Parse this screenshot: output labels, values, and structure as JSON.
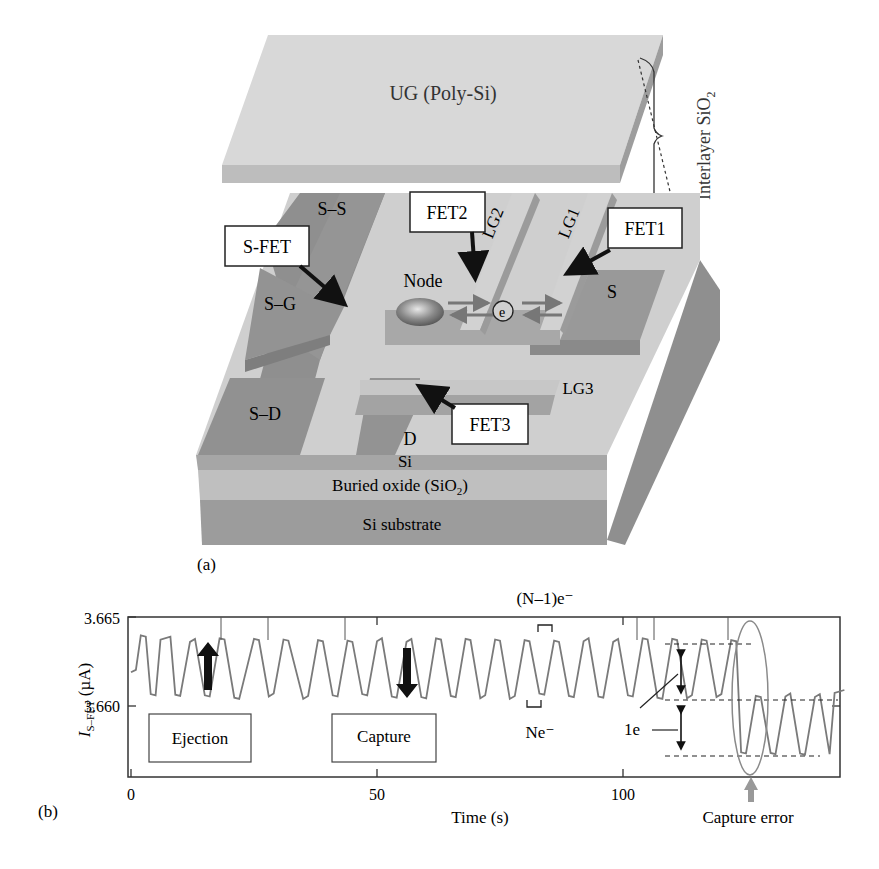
{
  "panel_a": {
    "label": "(a)",
    "top_gate": "UG (Poly-Si)",
    "interlayer": "Interlayer SiO",
    "interlayer_sub": "2",
    "regions": {
      "ss": "S–S",
      "sg": "S–G",
      "sd": "S–D",
      "s": "S",
      "d": "D",
      "lg1": "LG1",
      "lg2": "LG2",
      "lg3": "LG3",
      "node": "Node",
      "electron": "e",
      "si": "Si",
      "buried_oxide": "Buried oxide (SiO",
      "buried_oxide_sub": "2",
      "buried_oxide_close": ")",
      "substrate": "Si substrate"
    },
    "callouts": {
      "sfet": "S-FET",
      "fet1": "FET1",
      "fet2": "FET2",
      "fet3": "FET3"
    }
  },
  "panel_b": {
    "label": "(b)",
    "annotations": {
      "top_state": "(N–1)e⁻",
      "top_state_italic": "N",
      "bottom_state": "Ne⁻",
      "one_e": "1e",
      "ejection": "Ejection",
      "capture": "Capture",
      "capture_error": "Capture error"
    }
  },
  "chart_data": {
    "type": "line",
    "title": "",
    "xlabel": "Time (s)",
    "ylabel": "I_S-FET (µA)",
    "ylabel_main": "I",
    "ylabel_sub": "S–FET",
    "ylabel_unit": " (µA)",
    "xlim": [
      0,
      145
    ],
    "ylim": [
      3.6562,
      3.6653
    ],
    "x_ticks": [
      0,
      50,
      100
    ],
    "x_tick_labels": [
      "0",
      "50",
      "100"
    ],
    "y_ticks": [
      3.665,
      3.66
    ],
    "y_tick_labels": [
      "3.665",
      "3.660"
    ],
    "grid": false,
    "legend": null,
    "series": [
      {
        "name": "I_S-FET random telegraph signal",
        "levels_uA": {
          "(N-1)e-": 3.6636,
          "Ne-": 3.6606,
          "(N+1)e- after capture error": 3.6573
        },
        "description": "Current switches between two levels ~1e apart (≈0.003 µA); after capture error at ~t=124 s, current switches between lower pair of levels",
        "x": [
          0,
          1,
          2,
          3,
          4,
          5,
          6,
          8,
          9,
          10,
          12,
          13,
          15,
          16,
          18,
          19,
          21,
          22,
          25,
          26,
          28,
          29,
          31,
          32,
          35,
          36,
          38,
          39,
          41,
          42,
          44,
          45,
          47,
          48,
          50,
          51,
          53,
          54,
          56,
          57,
          59,
          60,
          62,
          63,
          65,
          66,
          68,
          69,
          71,
          72,
          74,
          75,
          77,
          78,
          80,
          81,
          83,
          84,
          86,
          87,
          89,
          90,
          92,
          93,
          95,
          96,
          98,
          99,
          101,
          102,
          104,
          105,
          107,
          108,
          110,
          111,
          113,
          114,
          116,
          117,
          119,
          120,
          122,
          123,
          124,
          125,
          127,
          128,
          130,
          131,
          133,
          134,
          136,
          137,
          139,
          140,
          142,
          143,
          145
        ],
        "y": [
          3.6618,
          3.662,
          3.664,
          3.664,
          3.6606,
          3.6606,
          3.6638,
          3.6638,
          3.6606,
          3.6606,
          3.6637,
          3.6637,
          3.6606,
          3.6606,
          3.6637,
          3.6637,
          3.6605,
          3.6605,
          3.6637,
          3.6637,
          3.6606,
          3.6606,
          3.6637,
          3.6637,
          3.6605,
          3.6605,
          3.6637,
          3.6637,
          3.6605,
          3.6605,
          3.6637,
          3.6637,
          3.6606,
          3.6606,
          3.6637,
          3.6637,
          3.6605,
          3.6605,
          3.6637,
          3.6637,
          3.6605,
          3.6605,
          3.6637,
          3.6637,
          3.6606,
          3.6606,
          3.6637,
          3.6637,
          3.6605,
          3.6605,
          3.6637,
          3.6637,
          3.6605,
          3.6605,
          3.6637,
          3.6637,
          3.6606,
          3.6606,
          3.6637,
          3.6637,
          3.6605,
          3.6605,
          3.6637,
          3.6637,
          3.6605,
          3.6605,
          3.6637,
          3.6637,
          3.6606,
          3.6606,
          3.6637,
          3.6637,
          3.6605,
          3.6605,
          3.6637,
          3.6637,
          3.6605,
          3.6605,
          3.6637,
          3.6637,
          3.6606,
          3.6606,
          3.6637,
          3.6637,
          3.6573,
          3.6573,
          3.6606,
          3.6606,
          3.6573,
          3.6573,
          3.6606,
          3.6606,
          3.6573,
          3.6573,
          3.6606,
          3.6606,
          3.6573,
          3.6608,
          3.6608
        ]
      }
    ],
    "annotations": [
      {
        "text": "Ejection",
        "type": "box",
        "arrow": "up",
        "x_approx": 14
      },
      {
        "text": "Capture",
        "type": "box",
        "arrow": "down",
        "x_approx": 55
      },
      {
        "text": "(N–1)e⁻",
        "x_approx": 81,
        "level": "upper"
      },
      {
        "text": "Ne⁻",
        "x_approx": 79,
        "level": "lower"
      },
      {
        "text": "1e",
        "x_approx": 112,
        "note": "double arrows showing 1-electron step"
      },
      {
        "text": "Capture error",
        "x_approx": 124,
        "note": "ellipse + gray up arrow"
      }
    ]
  },
  "colors": {
    "trace": "#7a7a7a",
    "ellipse": "#8a8a8a",
    "dark_region": "#8e8e8e",
    "light_region": "#cdcdcd",
    "top_gate": "#d6d6d6"
  }
}
